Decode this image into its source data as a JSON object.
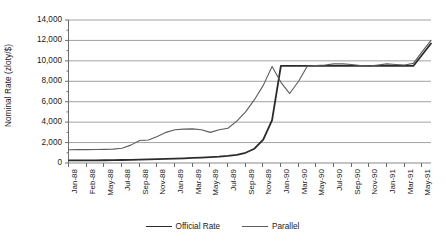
{
  "chart_data": {
    "type": "line",
    "title": "",
    "xlabel": "",
    "ylabel": "Nominal Rate (zloty/$)",
    "ylim": [
      0,
      14000
    ],
    "ytick_labels": [
      "0",
      "2,000",
      "4,000",
      "6,000",
      "8,000",
      "10,000",
      "12,000",
      "14,000"
    ],
    "ytick_values": [
      0,
      2000,
      4000,
      6000,
      8000,
      10000,
      12000,
      14000
    ],
    "grid": true,
    "legend_position": "bottom-center",
    "xtick_labels": [
      "Jan-88",
      "Feb-88",
      "May-88",
      "Jul-88",
      "Sep-88",
      "Nov-88",
      "Jan-89",
      "Mar-89",
      "May-89",
      "Jul-89",
      "Sep-89",
      "Nov-89",
      "Jan-90",
      "Mar-90",
      "May-90",
      "Jul-90",
      "Sep-90",
      "Nov-90",
      "Jan-91",
      "Mar-91",
      "May-91"
    ],
    "x": [
      "Jan-88",
      "Feb-88",
      "Mar-88",
      "Apr-88",
      "May-88",
      "Jun-88",
      "Jul-88",
      "Aug-88",
      "Sep-88",
      "Oct-88",
      "Nov-88",
      "Dec-88",
      "Jan-89",
      "Feb-89",
      "Mar-89",
      "Apr-89",
      "May-89",
      "Jun-89",
      "Jul-89",
      "Aug-89",
      "Sep-89",
      "Oct-89",
      "Nov-89",
      "Dec-89",
      "Jan-90",
      "Feb-90",
      "Mar-90",
      "Apr-90",
      "May-90",
      "Jun-90",
      "Jul-90",
      "Aug-90",
      "Sep-90",
      "Oct-90",
      "Nov-90",
      "Dec-90",
      "Jan-91",
      "Feb-91",
      "Mar-91",
      "Apr-91",
      "May-91",
      "Jun-91"
    ],
    "series": [
      {
        "name": "Official Rate",
        "color": "#2b2b2b",
        "width": 1.8,
        "values": [
          250,
          255,
          260,
          265,
          270,
          280,
          295,
          310,
          330,
          350,
          375,
          400,
          430,
          460,
          495,
          530,
          570,
          620,
          690,
          800,
          1000,
          1400,
          2300,
          4200,
          9500,
          9500,
          9500,
          9500,
          9500,
          9500,
          9500,
          9500,
          9500,
          9500,
          9500,
          9500,
          9500,
          9500,
          9500,
          9500,
          10600,
          11700
        ]
      },
      {
        "name": "Parallel",
        "color": "#5c5c5c",
        "width": 1.1,
        "values": [
          1300,
          1305,
          1310,
          1315,
          1330,
          1360,
          1450,
          1750,
          2200,
          2250,
          2600,
          3000,
          3250,
          3320,
          3340,
          3250,
          3000,
          3250,
          3400,
          4100,
          5000,
          6200,
          7600,
          9450,
          7900,
          6800,
          8000,
          9500,
          9550,
          9600,
          9700,
          9700,
          9650,
          9550,
          9500,
          9600,
          9700,
          9650,
          9600,
          9750,
          10900,
          12000
        ]
      }
    ]
  },
  "legend": {
    "entries": [
      {
        "label": "Official Rate"
      },
      {
        "label": "Parallel"
      }
    ]
  },
  "colors": {
    "official": "#2b2b2b",
    "parallel": "#5c5c5c",
    "grid": "#8a8a8a",
    "axis": "#6d6d6d",
    "background": "#ffffff"
  }
}
